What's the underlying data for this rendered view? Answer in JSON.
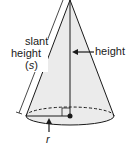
{
  "figure": {
    "labels": {
      "slant": "slant",
      "slant_height": "height",
      "slant_symbol_open": "(",
      "slant_symbol": "s",
      "slant_symbol_close": ")",
      "height": "height",
      "radius": "r"
    },
    "colors": {
      "fill": "#ebebeb",
      "stroke": "#1a1a1a",
      "background": "#ffffff"
    }
  }
}
